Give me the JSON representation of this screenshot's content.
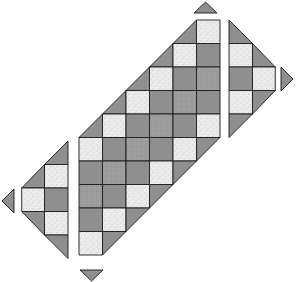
{
  "diagram": {
    "cell_size": 23.5,
    "colors": {
      "outline": "#1a1a1a",
      "white_fabric": "#ececec",
      "weave_fabric": "#7a7a7a",
      "gray_fabric": "#9c9c9c",
      "background": "#ffffff"
    },
    "fabric_types": [
      "white-speckle",
      "dark-basketweave",
      "medium-gray"
    ],
    "main_block": {
      "origin": [
        79,
        20
      ],
      "columns": 6,
      "rows": 10,
      "diagonal_sequence": [
        "white-speckle",
        "dark-basketweave",
        "medium-gray",
        "dark-basketweave",
        "white-speckle"
      ]
    },
    "right_piece": {
      "origin": [
        229,
        20
      ],
      "column_a": [
        "setting-triangle",
        "white-speckle",
        "dark-basketweave",
        "white-speckle",
        "setting-triangle"
      ],
      "column_b": [
        "setting-triangle",
        "white-speckle",
        "setting-triangle"
      ]
    },
    "left_piece": {
      "origin": [
        21,
        141
      ],
      "column_a": [
        "setting-triangle",
        "white-speckle",
        "dark-basketweave",
        "white-speckle",
        "setting-triangle"
      ],
      "column_b": [
        "setting-triangle",
        "white-speckle",
        "setting-triangle"
      ]
    },
    "corner_triangles": [
      {
        "name": "top",
        "points": [
          [
            194,
            13
          ],
          [
            205.5,
            2
          ],
          [
            217,
            13
          ]
        ]
      },
      {
        "name": "right",
        "points": [
          [
            281,
            67
          ],
          [
            293,
            79
          ],
          [
            281,
            91
          ]
        ]
      },
      {
        "name": "bottom",
        "points": [
          [
            80,
            270
          ],
          [
            103,
            270
          ],
          [
            91.5,
            281
          ]
        ]
      },
      {
        "name": "left",
        "points": [
          [
            14,
            189
          ],
          [
            2,
            201
          ],
          [
            14,
            213
          ]
        ]
      }
    ]
  }
}
